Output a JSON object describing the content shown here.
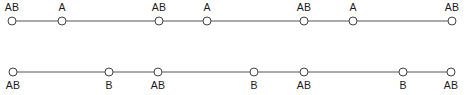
{
  "figure": {
    "type": "linkage-diagram",
    "background_color": "#ffffff",
    "line_color": "#555555",
    "node_stroke_color": "#444444",
    "node_fill_color": "#ffffff",
    "text_color": "#1a1a1a",
    "node_radius": 4,
    "rows": [
      {
        "id": "row-1",
        "name": "chromosome-row-1",
        "label_position": "above",
        "line_y": 21,
        "label_y": 2,
        "nodes": [
          {
            "id": "r1n1",
            "label": "AB",
            "x": 12
          },
          {
            "id": "r1n2",
            "label": "A",
            "x": 62
          },
          {
            "id": "r1n3",
            "label": "AB",
            "x": 159
          },
          {
            "id": "r1n4",
            "label": "A",
            "x": 207
          },
          {
            "id": "r1n5",
            "label": "AB",
            "x": 304
          },
          {
            "id": "r1n6",
            "label": "A",
            "x": 353
          },
          {
            "id": "r1n7",
            "label": "AB",
            "x": 452
          }
        ]
      },
      {
        "id": "row-2",
        "name": "chromosome-row-2",
        "label_position": "below",
        "line_y": 72,
        "label_y": 80,
        "nodes": [
          {
            "id": "r2n1",
            "label": "AB",
            "x": 13
          },
          {
            "id": "r2n2",
            "label": "B",
            "x": 109
          },
          {
            "id": "r2n3",
            "label": "AB",
            "x": 158
          },
          {
            "id": "r2n4",
            "label": "B",
            "x": 254
          },
          {
            "id": "r2n5",
            "label": "AB",
            "x": 304
          },
          {
            "id": "r2n6",
            "label": "B",
            "x": 403
          },
          {
            "id": "r2n7",
            "label": "AB",
            "x": 451
          }
        ]
      }
    ]
  }
}
